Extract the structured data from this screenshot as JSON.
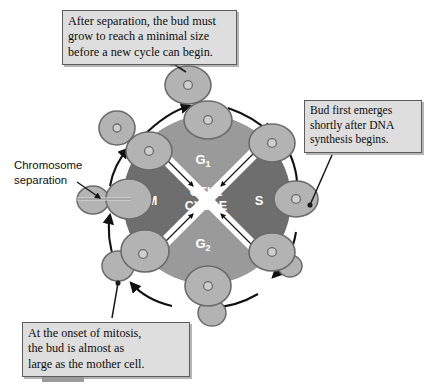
{
  "figure": {
    "center_label_line1": "CELL",
    "center_label_line2": "CYCLE",
    "phases": [
      {
        "id": "g1",
        "label": "G",
        "subscript": "1",
        "position": "top",
        "fill": "#9a9a9a"
      },
      {
        "id": "s",
        "label": "S",
        "subscript": "",
        "position": "right",
        "fill": "#6e6e6e"
      },
      {
        "id": "g2",
        "label": "G",
        "subscript": "2",
        "position": "bottom",
        "fill": "#9a9a9a"
      },
      {
        "id": "m",
        "label": "M",
        "subscript": "",
        "position": "left",
        "fill": "#6e6e6e"
      }
    ],
    "colors": {
      "background": "#ffffff",
      "phase_light": "#9a9a9a",
      "phase_dark": "#6e6e6e",
      "cell_fill": "#b3b3b3",
      "cell_stroke": "#6b6b6b",
      "nucleus_fill": "#cfcfcf",
      "arrow": "#111111",
      "callout_fill": "#dedede",
      "callout_border": "#5c5c5c",
      "phase_text": "#ffffff"
    }
  },
  "callouts": [
    {
      "id": "top",
      "lines": [
        "After separation, the bud must",
        "grow to reach a minimal size",
        "before a new cycle can begin."
      ]
    },
    {
      "id": "right",
      "lines": [
        "Bud first emerges",
        "shortly after DNA",
        "synthesis begins."
      ]
    },
    {
      "id": "bottom",
      "lines": [
        "At the onset of mitosis,",
        "the bud is almost as",
        "large as the mother cell."
      ]
    }
  ],
  "labels": {
    "chromosome_separation_line1": "Chromosome",
    "chromosome_separation_line2": "separation"
  },
  "cells": [
    {
      "id": "cell-top-detached",
      "stage": "newly separated daughter cell",
      "bud": "none"
    },
    {
      "id": "cell-top-ring",
      "stage": "unbudded G1 cell",
      "bud": "none"
    },
    {
      "id": "cell-upper-right",
      "stage": "unbudded, entering S",
      "bud": "none"
    },
    {
      "id": "cell-right",
      "stage": "bud first emerging",
      "bud": "small"
    },
    {
      "id": "cell-lower-right",
      "stage": "growing bud in G2",
      "bud": "medium"
    },
    {
      "id": "cell-bottom",
      "stage": "large bud at onset of mitosis",
      "bud": "large"
    },
    {
      "id": "cell-lower-left",
      "stage": "mitosis, bud nearly mother size",
      "bud": "large"
    },
    {
      "id": "cell-left",
      "stage": "chromosome separation",
      "bud": "separating"
    },
    {
      "id": "cell-upper-left",
      "stage": "separated daughter cell",
      "bud": "none"
    }
  ]
}
